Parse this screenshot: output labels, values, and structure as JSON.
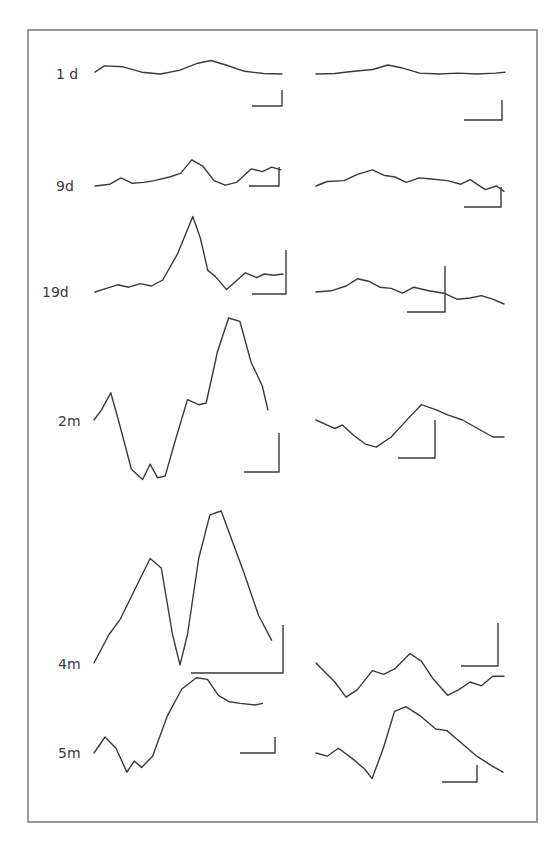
{
  "figure": {
    "type": "waveform-panel",
    "rows": [
      {
        "age_label": "1 d",
        "left_trace": [
          [
            0,
            0.2
          ],
          [
            0.05,
            0.9
          ],
          [
            0.15,
            0.8
          ],
          [
            0.25,
            0.2
          ],
          [
            0.35,
            0
          ],
          [
            0.45,
            0.4
          ],
          [
            0.55,
            1.2
          ],
          [
            0.62,
            1.5
          ],
          [
            0.7,
            1.0
          ],
          [
            0.8,
            0.3
          ],
          [
            0.9,
            0.05
          ],
          [
            1,
            0
          ]
        ],
        "right_trace": [
          [
            0,
            0
          ],
          [
            0.1,
            0.05
          ],
          [
            0.2,
            0.3
          ],
          [
            0.3,
            0.5
          ],
          [
            0.38,
            1.0
          ],
          [
            0.45,
            0.7
          ],
          [
            0.55,
            0.1
          ],
          [
            0.65,
            0
          ],
          [
            0.75,
            0.1
          ],
          [
            0.85,
            0
          ],
          [
            0.95,
            0.1
          ],
          [
            1,
            0.2
          ]
        ]
      },
      {
        "age_label": "9d",
        "left_trace": [
          [
            0,
            0
          ],
          [
            0.08,
            0.2
          ],
          [
            0.14,
            0.9
          ],
          [
            0.2,
            0.3
          ],
          [
            0.26,
            0.4
          ],
          [
            0.32,
            0.6
          ],
          [
            0.4,
            1.0
          ],
          [
            0.46,
            1.4
          ],
          [
            0.52,
            2.9
          ],
          [
            0.58,
            2.2
          ],
          [
            0.64,
            0.6
          ],
          [
            0.7,
            0.1
          ],
          [
            0.76,
            0.4
          ],
          [
            0.84,
            1.9
          ],
          [
            0.9,
            1.6
          ],
          [
            0.95,
            2.1
          ],
          [
            1,
            1.8
          ]
        ],
        "right_trace": [
          [
            0,
            0
          ],
          [
            0.06,
            0.5
          ],
          [
            0.15,
            0.6
          ],
          [
            0.22,
            1.3
          ],
          [
            0.3,
            1.8
          ],
          [
            0.36,
            1.2
          ],
          [
            0.42,
            1.0
          ],
          [
            0.48,
            0.4
          ],
          [
            0.55,
            0.9
          ],
          [
            0.6,
            0.8
          ],
          [
            0.7,
            0.6
          ],
          [
            0.77,
            0.2
          ],
          [
            0.82,
            0.7
          ],
          [
            0.9,
            -0.4
          ],
          [
            0.96,
            0.0
          ],
          [
            1,
            -0.6
          ]
        ]
      },
      {
        "age_label": "19d",
        "left_trace": [
          [
            0,
            0
          ],
          [
            0.06,
            0.3
          ],
          [
            0.12,
            0.6
          ],
          [
            0.18,
            0.4
          ],
          [
            0.24,
            0.7
          ],
          [
            0.3,
            0.5
          ],
          [
            0.36,
            1.0
          ],
          [
            0.44,
            3.2
          ],
          [
            0.52,
            6.3
          ],
          [
            0.56,
            4.5
          ],
          [
            0.6,
            1.8
          ],
          [
            0.64,
            1.3
          ],
          [
            0.7,
            0.2
          ],
          [
            0.8,
            1.6
          ],
          [
            0.86,
            1.2
          ],
          [
            0.9,
            1.5
          ],
          [
            0.95,
            1.4
          ],
          [
            1,
            1.5
          ]
        ],
        "right_trace": [
          [
            0,
            0
          ],
          [
            0.08,
            0.1
          ],
          [
            0.16,
            0.5
          ],
          [
            0.22,
            1.1
          ],
          [
            0.28,
            0.9
          ],
          [
            0.34,
            0.4
          ],
          [
            0.4,
            0.3
          ],
          [
            0.46,
            -0.1
          ],
          [
            0.52,
            0.4
          ],
          [
            0.6,
            0.1
          ],
          [
            0.68,
            -0.1
          ],
          [
            0.75,
            -0.6
          ],
          [
            0.82,
            -0.5
          ],
          [
            0.88,
            -0.3
          ],
          [
            0.94,
            -0.6
          ],
          [
            1,
            -1.0
          ]
        ]
      },
      {
        "age_label": "2m",
        "left_trace": [
          [
            0,
            0
          ],
          [
            0.04,
            0.6
          ],
          [
            0.09,
            1.6
          ],
          [
            0.14,
            -0.4
          ],
          [
            0.2,
            -2.9
          ],
          [
            0.26,
            -3.5
          ],
          [
            0.3,
            -2.6
          ],
          [
            0.34,
            -3.4
          ],
          [
            0.38,
            -3.3
          ],
          [
            0.44,
            -1.0
          ],
          [
            0.5,
            1.2
          ],
          [
            0.56,
            0.9
          ],
          [
            0.6,
            1.0
          ],
          [
            0.66,
            4.0
          ],
          [
            0.72,
            6.0
          ],
          [
            0.78,
            5.8
          ],
          [
            0.84,
            3.4
          ],
          [
            0.9,
            2.0
          ],
          [
            0.93,
            0.6
          ]
        ],
        "right_trace": [
          [
            0,
            0
          ],
          [
            0.06,
            -0.3
          ],
          [
            0.1,
            -0.5
          ],
          [
            0.14,
            -0.3
          ],
          [
            0.2,
            -0.9
          ],
          [
            0.26,
            -1.4
          ],
          [
            0.32,
            -1.6
          ],
          [
            0.4,
            -1.0
          ],
          [
            0.5,
            0.2
          ],
          [
            0.56,
            0.9
          ],
          [
            0.64,
            0.6
          ],
          [
            0.7,
            0.3
          ],
          [
            0.78,
            0.0
          ],
          [
            0.86,
            -0.5
          ],
          [
            0.94,
            -1.0
          ],
          [
            1,
            -1.0
          ]
        ]
      },
      {
        "age_label": "4m",
        "left_trace": [
          [
            0,
            0
          ],
          [
            0.08,
            1.5
          ],
          [
            0.14,
            2.3
          ],
          [
            0.2,
            3.5
          ],
          [
            0.3,
            5.5
          ],
          [
            0.36,
            5.0
          ],
          [
            0.42,
            1.5
          ],
          [
            0.46,
            -0.1
          ],
          [
            0.5,
            1.5
          ],
          [
            0.56,
            5.5
          ],
          [
            0.62,
            7.8
          ],
          [
            0.68,
            8.0
          ],
          [
            0.74,
            6.4
          ],
          [
            0.8,
            4.8
          ],
          [
            0.88,
            2.5
          ],
          [
            0.95,
            1.2
          ]
        ],
        "right_trace": [
          [
            0,
            0
          ],
          [
            0.06,
            -0.6
          ],
          [
            0.1,
            -1.0
          ],
          [
            0.16,
            -1.8
          ],
          [
            0.22,
            -1.4
          ],
          [
            0.3,
            -0.4
          ],
          [
            0.36,
            -0.6
          ],
          [
            0.42,
            -0.3
          ],
          [
            0.5,
            0.5
          ],
          [
            0.56,
            0.1
          ],
          [
            0.62,
            -0.8
          ],
          [
            0.7,
            -1.7
          ],
          [
            0.76,
            -1.4
          ],
          [
            0.82,
            -1.0
          ],
          [
            0.88,
            -1.2
          ],
          [
            0.94,
            -0.7
          ],
          [
            1,
            -0.7
          ]
        ]
      },
      {
        "age_label": "5m",
        "left_trace": [
          [
            0,
            0
          ],
          [
            0.06,
            1.0
          ],
          [
            0.12,
            0.3
          ],
          [
            0.18,
            -1.2
          ],
          [
            0.22,
            -0.5
          ],
          [
            0.26,
            -0.9
          ],
          [
            0.32,
            -0.2
          ],
          [
            0.4,
            2.3
          ],
          [
            0.48,
            4.0
          ],
          [
            0.56,
            4.7
          ],
          [
            0.62,
            4.6
          ],
          [
            0.68,
            3.6
          ],
          [
            0.74,
            3.2
          ],
          [
            0.8,
            3.1
          ],
          [
            0.88,
            3.0
          ],
          [
            0.92,
            3.1
          ]
        ],
        "right_trace": [
          [
            0,
            0
          ],
          [
            0.06,
            -0.2
          ],
          [
            0.12,
            0.3
          ],
          [
            0.2,
            -0.4
          ],
          [
            0.26,
            -1.0
          ],
          [
            0.3,
            -1.6
          ],
          [
            0.36,
            0.3
          ],
          [
            0.42,
            2.6
          ],
          [
            0.48,
            2.9
          ],
          [
            0.56,
            2.3
          ],
          [
            0.64,
            1.5
          ],
          [
            0.7,
            1.4
          ],
          [
            0.76,
            0.8
          ],
          [
            0.86,
            -0.2
          ],
          [
            0.94,
            -0.8
          ],
          [
            1,
            -1.2
          ]
        ]
      }
    ]
  }
}
